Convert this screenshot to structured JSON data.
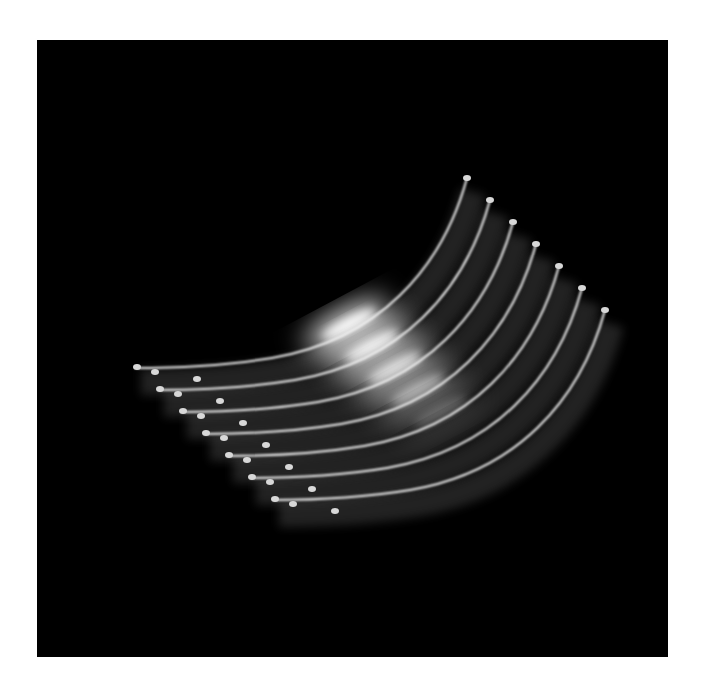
{
  "image": {
    "subject": "solar eclipse chromosphere sequence",
    "background_color": "#000000",
    "frame_color": "#ffffff",
    "arc_count": 7,
    "arc_color": "#f2f2f2",
    "glow_color": "#ffffff",
    "arcs": [
      {
        "dx": 0,
        "dy": 0,
        "glow": 1.0
      },
      {
        "dx": 23,
        "dy": 22,
        "glow": 0.85
      },
      {
        "dx": 46,
        "dy": 44,
        "glow": 0.7
      },
      {
        "dx": 69,
        "dy": 66,
        "glow": 0.45
      },
      {
        "dx": 92,
        "dy": 88,
        "glow": 0.15
      },
      {
        "dx": 115,
        "dy": 110,
        "glow": 0.08
      },
      {
        "dx": 138,
        "dy": 132,
        "glow": 0.05
      }
    ]
  }
}
